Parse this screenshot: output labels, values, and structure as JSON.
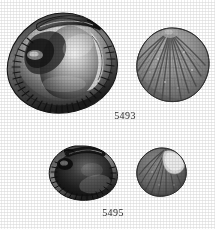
{
  "plate": {
    "background_color": "#ffffff",
    "ink_color": "#2b2b2b",
    "width": 215,
    "height": 229,
    "medium": "halftone-print-scan",
    "palette": {
      "darkest": "#141414",
      "dark": "#3a3a3a",
      "mid": "#6e6e6e",
      "light": "#a9a9a9",
      "highlight": "#e6e6e6",
      "paper": "#ffffff"
    }
  },
  "specimens": [
    {
      "id": "specimen-top-left",
      "view": "interior valve",
      "description": "bivalve shell interior with hinge, umbo and crenulated ventral margin",
      "icon": "bivalve-shell-interior-icon",
      "catalog_group": "5493"
    },
    {
      "id": "specimen-top-right",
      "view": "exterior valve",
      "description": "bivalve shell exterior with radial ribs",
      "icon": "bivalve-shell-exterior-icon",
      "catalog_group": "5493"
    },
    {
      "id": "specimen-bottom-left",
      "view": "interior valve",
      "description": "small bivalve shell interior, dark, crenulated margin",
      "icon": "bivalve-shell-interior-icon",
      "catalog_group": "5495"
    },
    {
      "id": "specimen-bottom-right",
      "view": "exterior valve",
      "description": "small bivalve shell exterior with radial ribs and pale eroded patch",
      "icon": "bivalve-shell-exterior-icon",
      "catalog_group": "5495"
    }
  ],
  "labels": [
    {
      "id": "label-5493",
      "text": "5493"
    },
    {
      "id": "label-5495",
      "text": "5495"
    }
  ]
}
